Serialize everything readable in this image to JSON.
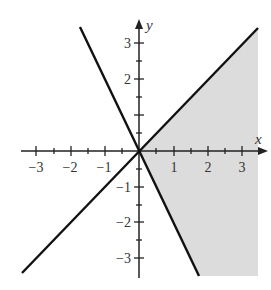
{
  "graph": {
    "x_axis_label": "x",
    "y_axis_label": "y",
    "x_ticks": [
      "−3",
      "−2",
      "−1",
      "1",
      "2",
      "3"
    ],
    "y_ticks": [
      "3",
      "2",
      "−1",
      "−2",
      "−3"
    ],
    "x_range": [
      -3.5,
      3.5
    ],
    "y_range": [
      -3.5,
      3.5
    ],
    "lines": [
      {
        "name": "line-y-equals-x",
        "equation": "y = x"
      },
      {
        "name": "line-y-equals-minus-2x",
        "equation": "y = -2x"
      }
    ],
    "shaded_region": "y <= x and y >= -2x (right of both lines)",
    "shade_color": "#d9d9d9",
    "line_color": "#111111"
  }
}
